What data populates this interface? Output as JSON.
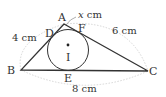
{
  "figure": {
    "type": "triangle-with-incircle",
    "points": {
      "A": "A",
      "B": "B",
      "C": "C",
      "D": "D",
      "E": "E",
      "F": "F",
      "I": "I"
    },
    "dimensions": {
      "AB": "4 cm",
      "AC": "6 cm",
      "BC": "8 cm",
      "AF_var": "x",
      "AF_unit": " cm"
    },
    "colors": {
      "stroke": "#333333",
      "dim_arc": "#d0d0d0",
      "text": "#333333"
    }
  }
}
